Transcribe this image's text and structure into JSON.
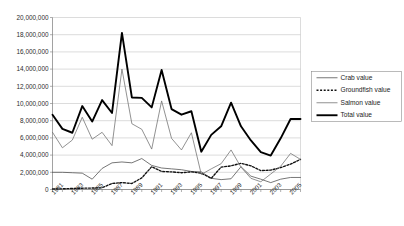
{
  "chart_data": {
    "type": "line",
    "title": "",
    "xlabel": "",
    "ylabel": "",
    "ylim": [
      0,
      20000000
    ],
    "ytick_values": [
      0,
      2000000,
      4000000,
      6000000,
      8000000,
      10000000,
      12000000,
      14000000,
      16000000,
      18000000,
      20000000
    ],
    "ytick_labels": [
      "0",
      "2,000,000",
      "4,000,000",
      "6,000,000",
      "8,000,000",
      "10,000,000",
      "12,000,000",
      "14,000,000",
      "16,000,000",
      "18,000,000",
      "20,000,000"
    ],
    "grid": true,
    "legend_position": "right",
    "x": [
      1981,
      1982,
      1983,
      1984,
      1985,
      1986,
      1987,
      1988,
      1989,
      1990,
      1991,
      1992,
      1993,
      1994,
      1995,
      1996,
      1997,
      1998,
      1999,
      2000,
      2001,
      2002,
      2003,
      2004,
      2005,
      2006
    ],
    "xtick_labels": [
      "1981",
      "1983",
      "1985",
      "1987",
      "1989",
      "1991",
      "1993",
      "1995",
      "1997",
      "1999",
      "2001",
      "2003",
      "2005"
    ],
    "xtick_years": [
      1981,
      1983,
      1985,
      1987,
      1989,
      1991,
      1993,
      1995,
      1997,
      1999,
      2001,
      2003,
      2005
    ],
    "series": [
      {
        "name": "Crab value",
        "style": "thin-solid",
        "color": "#4a4a4a",
        "values": [
          2000000,
          2000000,
          1950000,
          1900000,
          1200000,
          2450000,
          3100000,
          3200000,
          3100000,
          3600000,
          2800000,
          2500000,
          2400000,
          2300000,
          2100000,
          2050000,
          1300000,
          1150000,
          1250000,
          2650000,
          1550000,
          1200000,
          800000,
          1200000,
          1400000,
          1400000
        ]
      },
      {
        "name": "Groundfish value",
        "style": "dashed",
        "color": "#111111",
        "values": [
          60000,
          80000,
          120000,
          150000,
          170000,
          200000,
          700000,
          800000,
          700000,
          1350000,
          2650000,
          2100000,
          2050000,
          1950000,
          2050000,
          1900000,
          1300000,
          2600000,
          2750000,
          3050000,
          2750000,
          2200000,
          2250000,
          2550000,
          2950000,
          3500000
        ]
      },
      {
        "name": "Salmon value",
        "style": "thin-solid",
        "color": "#6e6e6e",
        "values": [
          6650000,
          4850000,
          5750000,
          8400000,
          5850000,
          6650000,
          5100000,
          14000000,
          7650000,
          7000000,
          4700000,
          10300000,
          5950000,
          4600000,
          6600000,
          1750000,
          2400000,
          3000000,
          4600000,
          2600000,
          1300000,
          900000,
          1800000,
          2700000,
          4200000,
          3500000
        ]
      },
      {
        "name": "Total value",
        "style": "thick-solid",
        "color": "#000000",
        "values": [
          8700000,
          7050000,
          6600000,
          9700000,
          7900000,
          10400000,
          8900000,
          18200000,
          10700000,
          10650000,
          9550000,
          13900000,
          9350000,
          8700000,
          9100000,
          4400000,
          6350000,
          7350000,
          10100000,
          7350000,
          5700000,
          4350000,
          3950000,
          5950000,
          8200000,
          8200000
        ]
      }
    ]
  },
  "legend": {
    "items": [
      {
        "label": "Crab value"
      },
      {
        "label": "Groundfish value"
      },
      {
        "label": "Salmon value"
      },
      {
        "label": "Total value"
      }
    ]
  }
}
